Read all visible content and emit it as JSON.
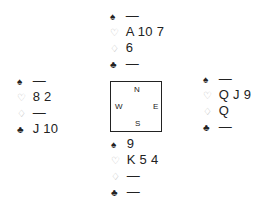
{
  "suits": {
    "spade": {
      "symbol": "♠",
      "tone": "dark"
    },
    "heart": {
      "symbol": "♡",
      "tone": "light"
    },
    "diamond": {
      "symbol": "♢",
      "tone": "light"
    },
    "club": {
      "symbol": "♣",
      "tone": "dark"
    }
  },
  "hands": {
    "north": {
      "spades": "—",
      "hearts": "A 10 7",
      "diamonds": "6",
      "clubs": "—"
    },
    "west": {
      "spades": "—",
      "hearts": "8 2",
      "diamonds": "—",
      "clubs": "J 10"
    },
    "east": {
      "spades": "—",
      "hearts": "Q J 9",
      "diamonds": "Q",
      "clubs": "—"
    },
    "south": {
      "spades": "9",
      "hearts": "K 5 4",
      "diamonds": "—",
      "clubs": "—"
    }
  },
  "compass": {
    "north": "N",
    "south": "S",
    "west": "W",
    "east": "E"
  },
  "colors": {
    "text": "#222222",
    "red_suit_outline": "#b8b8b8",
    "border": "#222222"
  }
}
